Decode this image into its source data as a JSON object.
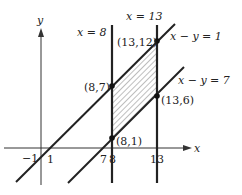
{
  "diagram": {
    "axes": {
      "x_label": "x",
      "y_label": "y"
    },
    "vertical_lines": [
      {
        "label": "x = 8",
        "x": 8
      },
      {
        "label": "x = 13",
        "x": 13
      }
    ],
    "diagonal_lines": [
      {
        "label": "x − y = 1",
        "x_intercept": 1
      },
      {
        "label": "x − y = 7",
        "x_intercept": 7
      }
    ],
    "points": [
      {
        "label": "(13,12)",
        "x": 13,
        "y": 12
      },
      {
        "label": "(8,7)",
        "x": 8,
        "y": 7
      },
      {
        "label": "(13,6)",
        "x": 13,
        "y": 6
      },
      {
        "label": "(8,1)",
        "x": 8,
        "y": 1
      }
    ],
    "x_ticks": [
      "−1",
      "1",
      "7",
      "8",
      "13"
    ],
    "shaded_region": "parallelogram bounded by x = 8, x = 13, x − y = 1, x − y = 7"
  }
}
